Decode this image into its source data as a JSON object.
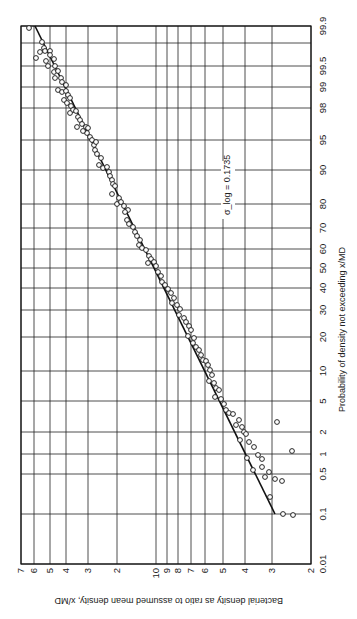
{
  "chart_data": {
    "type": "scatter",
    "subtype": "log-probability plot (rotated 90 degrees)",
    "title": "",
    "xlabel": "Bacterial density as ratio to assumed mean density, x/MD",
    "ylabel": "Probability of density not exceeding x/MD",
    "x_scale": "log",
    "y_scale": "probability",
    "xlim": [
      0.2,
      7
    ],
    "ylim": [
      0.01,
      99.9
    ],
    "grid": true,
    "annotation": "σ_log = 0.1735",
    "density_ticks": [
      {
        "label": "7",
        "value": 7,
        "px": 21
      },
      {
        "label": "6",
        "value": 6,
        "px": 34
      },
      {
        "label": "5",
        "value": 5,
        "px": 50
      },
      {
        "label": "4",
        "value": 4,
        "px": 66
      },
      {
        "label": "3",
        "value": 3,
        "px": 88
      },
      {
        "label": "2",
        "value": 2,
        "px": 117
      },
      {
        "label": "10",
        "value": 1.0,
        "px": 156
      },
      {
        "label": "9",
        "value": 0.9,
        "px": 167
      },
      {
        "label": "8",
        "value": 0.8,
        "px": 178
      },
      {
        "label": "7",
        "value": 0.7,
        "px": 191
      },
      {
        "label": "6",
        "value": 0.6,
        "px": 205
      },
      {
        "label": "5",
        "value": 0.5,
        "px": 223
      },
      {
        "label": "4",
        "value": 0.4,
        "px": 245
      },
      {
        "label": "3",
        "value": 0.3,
        "px": 272
      },
      {
        "label": "2",
        "value": 0.2,
        "px": 311
      }
    ],
    "probability_ticks": [
      {
        "label": "99.9",
        "value": 99.9,
        "px": 26
      },
      {
        "label": "",
        "value": 99.8,
        "px": 43
      },
      {
        "label": "99.5",
        "value": 99.5,
        "px": 66
      },
      {
        "label": "99",
        "value": 99,
        "px": 87
      },
      {
        "label": "98",
        "value": 98,
        "px": 108
      },
      {
        "label": "95",
        "value": 95,
        "px": 140
      },
      {
        "label": "90",
        "value": 90,
        "px": 170
      },
      {
        "label": "80",
        "value": 80,
        "px": 204
      },
      {
        "label": "70",
        "value": 70,
        "px": 228
      },
      {
        "label": "60",
        "value": 60,
        "px": 249
      },
      {
        "label": "50",
        "value": 50,
        "px": 268
      },
      {
        "label": "40",
        "value": 40,
        "px": 288
      },
      {
        "label": "30",
        "value": 30,
        "px": 310
      },
      {
        "label": "20",
        "value": 20,
        "px": 337
      },
      {
        "label": "10",
        "value": 10,
        "px": 371
      },
      {
        "label": "5",
        "value": 5,
        "px": 401
      },
      {
        "label": "2",
        "value": 2,
        "px": 432
      },
      {
        "label": "1",
        "value": 1,
        "px": 454
      },
      {
        "label": "0.5",
        "value": 0.5,
        "px": 474
      },
      {
        "label": "0.1",
        "value": 0.1,
        "px": 514
      },
      {
        "label": "0.01",
        "value": 0.01,
        "px": 564
      }
    ],
    "fit_line": {
      "description": "log-normal fit, density ~6.5 at 99.9% to ~0.3 at 0.1%",
      "from": {
        "density": 6.5,
        "probability": 99.9
      },
      "to": {
        "density": 0.3,
        "probability": 0.1
      }
    },
    "series": [
      {
        "name": "observed densities",
        "marker": "open circle",
        "points_px": [
          [
            29,
            28
          ],
          [
            42,
            42
          ],
          [
            44,
            48
          ],
          [
            40,
            52
          ],
          [
            45,
            51
          ],
          [
            50,
            51
          ],
          [
            36,
            58
          ],
          [
            50,
            55
          ],
          [
            46,
            61
          ],
          [
            54,
            59
          ],
          [
            48,
            66
          ],
          [
            55,
            66
          ],
          [
            54,
            72
          ],
          [
            58,
            71
          ],
          [
            55,
            78
          ],
          [
            61,
            78
          ],
          [
            62,
            82
          ],
          [
            66,
            85
          ],
          [
            58,
            90
          ],
          [
            62,
            92
          ],
          [
            66,
            91
          ],
          [
            68,
            95
          ],
          [
            64,
            100
          ],
          [
            70,
            98
          ],
          [
            67,
            103
          ],
          [
            71,
            106
          ],
          [
            73,
            110
          ],
          [
            70,
            113
          ],
          [
            76,
            111
          ],
          [
            78,
            117
          ],
          [
            80,
            120
          ],
          [
            77,
            127
          ],
          [
            82,
            124
          ],
          [
            86,
            127
          ],
          [
            88,
            128
          ],
          [
            87,
            133
          ],
          [
            83,
            131
          ],
          [
            90,
            137
          ],
          [
            92,
            140
          ],
          [
            94,
            145
          ],
          [
            96,
            142
          ],
          [
            95,
            150
          ],
          [
            97,
            154
          ],
          [
            101,
            158
          ],
          [
            99,
            165
          ],
          [
            103,
            168
          ],
          [
            107,
            167
          ],
          [
            109,
            172
          ],
          [
            110,
            176
          ],
          [
            112,
            180
          ],
          [
            113,
            184
          ],
          [
            115,
            186
          ],
          [
            112,
            194
          ],
          [
            119,
            198
          ],
          [
            117,
            204
          ],
          [
            121,
            202
          ],
          [
            124,
            206
          ],
          [
            128,
            210
          ],
          [
            125,
            212
          ],
          [
            127,
            220
          ],
          [
            129,
            224
          ],
          [
            133,
            227
          ],
          [
            135,
            232
          ],
          [
            137,
            236
          ],
          [
            140,
            240
          ],
          [
            139,
            245
          ],
          [
            142,
            248
          ],
          [
            146,
            250
          ],
          [
            149,
            256
          ],
          [
            151,
            259
          ],
          [
            148,
            263
          ],
          [
            154,
            262
          ],
          [
            156,
            266
          ],
          [
            158,
            272
          ],
          [
            161,
            276
          ],
          [
            162,
            282
          ],
          [
            165,
            285
          ],
          [
            168,
            289
          ],
          [
            171,
            293
          ],
          [
            174,
            298
          ],
          [
            172,
            303
          ],
          [
            177,
            305
          ],
          [
            180,
            309
          ],
          [
            179,
            315
          ],
          [
            184,
            318
          ],
          [
            186,
            322
          ],
          [
            189,
            326
          ],
          [
            191,
            330
          ],
          [
            188,
            336
          ],
          [
            194,
            338
          ],
          [
            193,
            343
          ],
          [
            196,
            347
          ],
          [
            199,
            350
          ],
          [
            201,
            355
          ],
          [
            203,
            360
          ],
          [
            206,
            361
          ],
          [
            208,
            365
          ],
          [
            210,
            370
          ],
          [
            212,
            375
          ],
          [
            209,
            381
          ],
          [
            214,
            383
          ],
          [
            216,
            388
          ],
          [
            219,
            390
          ],
          [
            215,
            397
          ],
          [
            221,
            399
          ],
          [
            224,
            404
          ],
          [
            226,
            410
          ],
          [
            229,
            413
          ],
          [
            233,
            414
          ],
          [
            239,
            420
          ],
          [
            236,
            425
          ],
          [
            242,
            427
          ],
          [
            244,
            432
          ],
          [
            246,
            434
          ],
          [
            240,
            440
          ],
          [
            249,
            442
          ],
          [
            254,
            447
          ],
          [
            258,
            455
          ],
          [
            247,
            458
          ],
          [
            262,
            459
          ],
          [
            262,
            467
          ],
          [
            253,
            470
          ],
          [
            269,
            472
          ],
          [
            265,
            477
          ],
          [
            275,
            479
          ],
          [
            282,
            481
          ],
          [
            270,
            497
          ],
          [
            283,
            514
          ],
          [
            293,
            515
          ],
          [
            277,
            422
          ],
          [
            292,
            451
          ]
        ]
      }
    ]
  }
}
